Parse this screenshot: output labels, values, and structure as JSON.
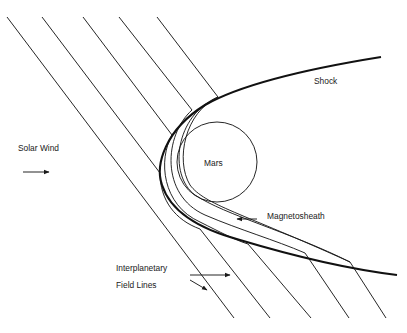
{
  "figure": {
    "labels": {
      "shock": "Shock",
      "solar_wind": "Solar Wind",
      "mars": "Mars",
      "magnetosheath": "Magnetosheath",
      "field_lines_1": "Interplanetary",
      "field_lines_2": "Field Lines"
    },
    "colors": {
      "ink": "#1a1a1a",
      "background": "#ffffff"
    }
  }
}
